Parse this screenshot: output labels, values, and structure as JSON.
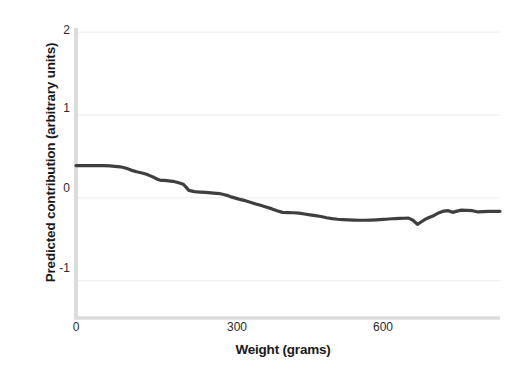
{
  "chart_data": {
    "type": "line",
    "title": "",
    "xlabel": "Weight (grams)",
    "ylabel": "Predicted contribution (arbitrary units)",
    "xlim": [
      0,
      770
    ],
    "ylim": [
      -1.45,
      2.05
    ],
    "xticks": [
      0,
      300,
      600
    ],
    "xticklabels": [
      "0",
      "300",
      "600"
    ],
    "yticks": [
      2,
      1,
      0,
      -1
    ],
    "yticklabels": [
      "2",
      "1",
      "0",
      "-1"
    ],
    "grid": "horizontal",
    "legend": "none",
    "series": [
      {
        "name": "Predicted contribution",
        "color": "#3f3f3f",
        "linewidth": 3.2,
        "x": [
          0,
          12,
          25,
          38,
          50,
          62,
          70,
          80,
          90,
          100,
          110,
          120,
          128,
          135,
          142,
          148,
          152,
          156,
          160,
          168,
          176,
          185,
          195,
          205,
          215,
          225,
          235,
          245,
          255,
          262,
          268,
          274,
          280,
          288,
          296,
          305,
          315,
          325,
          335,
          345,
          355,
          365,
          375,
          385,
          395,
          405,
          415,
          425,
          435,
          445,
          455,
          465,
          475,
          485,
          495,
          505,
          515,
          525,
          535,
          545,
          552,
          558,
          563,
          568,
          574,
          580,
          588,
          596,
          604,
          612,
          620,
          628,
          634,
          640,
          648,
          656,
          662,
          668,
          676,
          684,
          692,
          700,
          710,
          720,
          730,
          740,
          750,
          762,
          770
        ],
        "y": [
          0.39,
          0.39,
          0.39,
          0.39,
          0.39,
          0.385,
          0.38,
          0.375,
          0.36,
          0.335,
          0.315,
          0.3,
          0.285,
          0.265,
          0.245,
          0.225,
          0.215,
          0.212,
          0.21,
          0.205,
          0.2,
          0.185,
          0.165,
          0.09,
          0.075,
          0.07,
          0.065,
          0.06,
          0.055,
          0.05,
          0.04,
          0.03,
          0.015,
          0.0,
          -0.015,
          -0.03,
          -0.05,
          -0.07,
          -0.09,
          -0.11,
          -0.13,
          -0.155,
          -0.175,
          -0.178,
          -0.18,
          -0.185,
          -0.195,
          -0.205,
          -0.215,
          -0.225,
          -0.24,
          -0.25,
          -0.258,
          -0.262,
          -0.265,
          -0.268,
          -0.27,
          -0.27,
          -0.268,
          -0.265,
          -0.262,
          -0.26,
          -0.258,
          -0.255,
          -0.252,
          -0.25,
          -0.248,
          -0.246,
          -0.245,
          -0.27,
          -0.32,
          -0.285,
          -0.26,
          -0.24,
          -0.22,
          -0.19,
          -0.175,
          -0.16,
          -0.155,
          -0.175,
          -0.16,
          -0.148,
          -0.15,
          -0.155,
          -0.17,
          -0.165,
          -0.162,
          -0.162,
          -0.162
        ]
      }
    ]
  },
  "axes": {
    "spine_color": "#d9d9d9",
    "grid_color": "#ececec",
    "tick_text_color": "#2b2b2b",
    "label_text_color": "#1a1a1a",
    "background": "#ffffff"
  }
}
